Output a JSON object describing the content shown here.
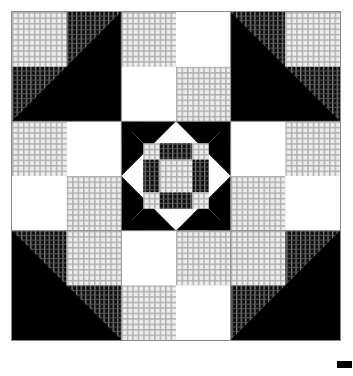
{
  "image": {
    "title": "Pieced quilt block pattern",
    "kind": "quilt-block-diagram",
    "width": 353,
    "height": 376,
    "background_color": "#ffffff"
  },
  "quilt": {
    "name": "Nine-patch star quilt block",
    "frame": {
      "x": 11,
      "y": 11,
      "size": 330,
      "border_color": "#8a8a8a",
      "border_width": 1
    },
    "grid": {
      "rows": 3,
      "cols": 3,
      "unit_size": 110,
      "seam_line_color": "#8a8a8a"
    },
    "fabrics": {
      "white": {
        "label": "plain white",
        "color": "#ffffff"
      },
      "black": {
        "label": "solid black",
        "color": "#000000"
      },
      "light_hatch": {
        "label": "light checked print",
        "base_color": "#ebebeb",
        "line_color": "#a8a8a8"
      },
      "dark_hatch": {
        "label": "dark striped print",
        "base_color": "#111111",
        "line_color": "#8c8c8c"
      }
    },
    "units": [
      {
        "position": "top-left",
        "type": "four-patch-with-triangle",
        "patches": [
          "light_hatch",
          "dark_hatch",
          "dark_hatch",
          "light_hatch"
        ],
        "triangle": "black half-square, hypotenuse from lower-left to upper-right"
      },
      {
        "position": "top-center",
        "type": "four-patch-with-notch",
        "patches": [
          "light_hatch",
          "white",
          "white",
          "light_hatch"
        ],
        "triangle": "black notch opening downward toward center"
      },
      {
        "position": "top-right",
        "type": "four-patch-with-triangle",
        "patches": [
          "dark_hatch",
          "light_hatch",
          "light_hatch",
          "dark_hatch"
        ],
        "triangle": "black half-square, hypotenuse from upper-left to lower-right"
      },
      {
        "position": "middle-left",
        "type": "four-patch-with-notch",
        "patches": [
          "light_hatch",
          "white",
          "white",
          "light_hatch"
        ],
        "triangle": "black notch opening rightward toward center"
      },
      {
        "position": "center",
        "type": "square-in-octagon",
        "ring": "white octagon ring with black corner triangles",
        "center_grid": {
          "rows": 4,
          "cols": 4,
          "cells": [
            "light_hatch",
            "dark_hatch",
            "dark_hatch",
            "light_hatch",
            "dark_hatch",
            "light_hatch",
            "light_hatch",
            "dark_hatch",
            "dark_hatch",
            "light_hatch",
            "light_hatch",
            "dark_hatch",
            "light_hatch",
            "dark_hatch",
            "dark_hatch",
            "light_hatch"
          ]
        }
      },
      {
        "position": "middle-right",
        "type": "four-patch-with-notch",
        "patches": [
          "light_hatch",
          "white",
          "white",
          "light_hatch"
        ],
        "triangle": "black notch opening leftward toward center"
      },
      {
        "position": "bottom-left",
        "type": "four-patch-with-triangle",
        "patches": [
          "dark_hatch",
          "light_hatch",
          "light_hatch",
          "dark_hatch"
        ],
        "triangle": "black half-square, hypotenuse from upper-left to lower-right"
      },
      {
        "position": "bottom-center",
        "type": "four-patch-with-notch",
        "patches": [
          "light_hatch",
          "white",
          "white",
          "light_hatch"
        ],
        "triangle": "black notch opening upward toward center"
      },
      {
        "position": "bottom-right",
        "type": "four-patch-with-triangle",
        "patches": [
          "light_hatch",
          "dark_hatch",
          "dark_hatch",
          "light_hatch"
        ],
        "triangle": "black half-square, hypotenuse from lower-left to upper-right"
      }
    ]
  },
  "print_mark": {
    "label": "registration mark",
    "color": "#000000",
    "x": 337,
    "y": 361,
    "width": 15,
    "height": 7
  }
}
